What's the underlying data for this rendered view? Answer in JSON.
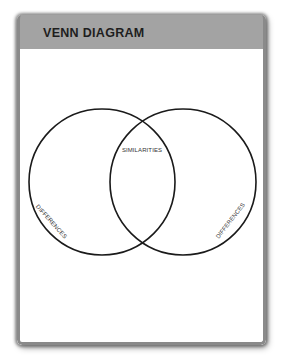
{
  "header": {
    "title": "VENN DIAGRAM"
  },
  "diagram": {
    "type": "venn",
    "circles": [
      {
        "name": "left",
        "cx": 102,
        "cy": 182,
        "r": 73
      },
      {
        "name": "right",
        "cx": 183,
        "cy": 182,
        "r": 73
      }
    ],
    "labels": {
      "intersection": "SIMILARITIES",
      "left_only": "DIFFERENCES",
      "right_only": "DIFFERENCES"
    }
  },
  "colors": {
    "header_bg": "#a3a3a3",
    "title": "#1e1e1e",
    "stroke": "#1a1a1a"
  }
}
